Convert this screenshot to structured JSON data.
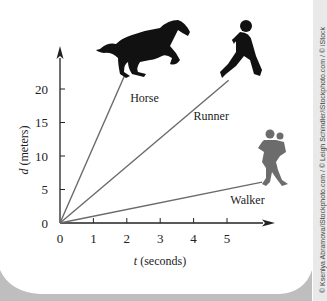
{
  "chart_data": {
    "type": "line",
    "title": "",
    "xlabel_var": "t",
    "xlabel_unit": " (seconds)",
    "ylabel_var": "d",
    "ylabel_unit": " (meters)",
    "x_ticks": [
      0,
      1,
      2,
      3,
      4,
      5
    ],
    "y_ticks": [
      0,
      5,
      10,
      15,
      20
    ],
    "xlim": [
      0,
      6.3
    ],
    "ylim": [
      0,
      24
    ],
    "grid": false,
    "legend": "inline labels",
    "series": [
      {
        "name": "Horse",
        "label": "Horse",
        "x": [
          0,
          1.95
        ],
        "y": [
          0,
          22.2
        ],
        "slope_m_per_s": 11.4,
        "label_pos": [
          2.1,
          18.0
        ],
        "icon": "horse-silhouette"
      },
      {
        "name": "Runner",
        "label": "Runner",
        "x": [
          0,
          5.05
        ],
        "y": [
          0,
          21.3
        ],
        "slope_m_per_s": 4.2,
        "label_pos": [
          4.0,
          15.3
        ],
        "icon": "runner-silhouette"
      },
      {
        "name": "Walker",
        "label": "Walker",
        "x": [
          0,
          6.05
        ],
        "y": [
          0,
          6.1
        ],
        "slope_m_per_s": 1.0,
        "label_pos": [
          5.1,
          2.8
        ],
        "icon": "walker-silhouette"
      }
    ],
    "line_color": "#6a6a6a",
    "axis_color": "#222222",
    "text_color": "#222222"
  },
  "credit": "© Ksenlya Abramova/iStockphoto.com / © Leigh Schindler/iStockphoto.com / © iStock"
}
